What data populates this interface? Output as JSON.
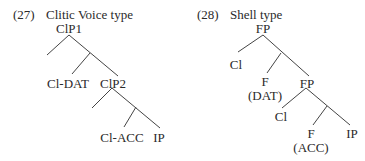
{
  "diagrams": [
    {
      "number": "(27)",
      "title": "Clitic Voice type",
      "nodes": {
        "root": "ClP1",
        "spec1": "Cl-DAT",
        "inner": "ClP2",
        "spec2": "Cl-ACC",
        "complement": "IP"
      }
    },
    {
      "number": "(28)",
      "title": "Shell type",
      "nodes": {
        "root": "FP",
        "spec1": "Cl",
        "head1": "F",
        "head1_feature": "(DAT)",
        "inner": "FP",
        "spec2": "Cl",
        "head2": "F",
        "head2_feature": "(ACC)",
        "complement": "IP"
      }
    }
  ]
}
